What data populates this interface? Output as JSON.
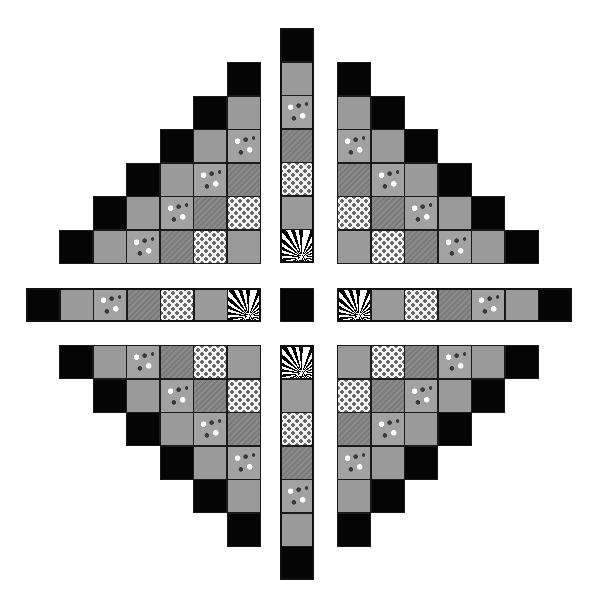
{
  "diagram": {
    "title": "",
    "legend": {
      "B": {
        "name": "black solid",
        "color": "#050505"
      },
      "G": {
        "name": "gray solid",
        "color": "#9a9a9a"
      },
      "D": {
        "name": "dark gray stripe",
        "color": "#7c7c7c"
      },
      "F": {
        "name": "gray with scattered white flowers",
        "color": "#a2a2a2"
      },
      "W": {
        "name": "white with small gray flowers",
        "color": "#f4f4f4"
      },
      "X": {
        "name": "large black and white flower print",
        "color": "#000000"
      }
    },
    "cell_size": 33.5,
    "pieces": {
      "top_left_triangle": {
        "x": 59,
        "y": 62,
        "rows": [
          [
            "",
            "",
            "",
            "",
            "",
            "B"
          ],
          [
            "",
            "",
            "",
            "",
            "B",
            "G"
          ],
          [
            "",
            "",
            "",
            "B",
            "G",
            "F"
          ],
          [
            "",
            "",
            "B",
            "G",
            "F",
            "D"
          ],
          [
            "",
            "B",
            "G",
            "F",
            "D",
            "W"
          ],
          [
            "B",
            "G",
            "F",
            "D",
            "W",
            "G"
          ]
        ]
      },
      "top_right_triangle": {
        "x": 337,
        "y": 62,
        "rows": [
          [
            "B",
            "",
            "",
            "",
            "",
            ""
          ],
          [
            "G",
            "B",
            "",
            "",
            "",
            ""
          ],
          [
            "F",
            "G",
            "B",
            "",
            "",
            ""
          ],
          [
            "D",
            "F",
            "G",
            "B",
            "",
            ""
          ],
          [
            "W",
            "D",
            "F",
            "G",
            "B",
            ""
          ],
          [
            "G",
            "W",
            "D",
            "F",
            "G",
            "B"
          ]
        ]
      },
      "bottom_left_triangle": {
        "x": 59,
        "y": 345,
        "rows": [
          [
            "B",
            "G",
            "F",
            "D",
            "W",
            "G"
          ],
          [
            "",
            "B",
            "G",
            "F",
            "D",
            "W"
          ],
          [
            "",
            "",
            "B",
            "G",
            "F",
            "D"
          ],
          [
            "",
            "",
            "",
            "B",
            "G",
            "F"
          ],
          [
            "",
            "",
            "",
            "",
            "B",
            "G"
          ],
          [
            "",
            "",
            "",
            "",
            "",
            "B"
          ]
        ]
      },
      "bottom_right_triangle": {
        "x": 337,
        "y": 345,
        "rows": [
          [
            "G",
            "W",
            "D",
            "F",
            "G",
            "B"
          ],
          [
            "W",
            "D",
            "F",
            "G",
            "B",
            ""
          ],
          [
            "D",
            "F",
            "G",
            "B",
            "",
            ""
          ],
          [
            "F",
            "G",
            "B",
            "",
            "",
            ""
          ],
          [
            "G",
            "B",
            "",
            "",
            "",
            ""
          ],
          [
            "B",
            "",
            "",
            "",
            "",
            ""
          ]
        ]
      },
      "top_strip": {
        "x": 280,
        "y": 28,
        "orientation": "vertical",
        "cells": [
          "B",
          "G",
          "F",
          "D",
          "W",
          "G",
          "X"
        ]
      },
      "bottom_strip": {
        "x": 280,
        "y": 345,
        "orientation": "vertical",
        "cells": [
          "X",
          "G",
          "W",
          "D",
          "F",
          "G",
          "B"
        ]
      },
      "left_strip": {
        "x": 26,
        "y": 288,
        "orientation": "horizontal",
        "cells": [
          "B",
          "G",
          "F",
          "D",
          "W",
          "G",
          "X"
        ]
      },
      "right_strip": {
        "x": 337,
        "y": 288,
        "orientation": "horizontal",
        "cells": [
          "X",
          "G",
          "W",
          "D",
          "F",
          "G",
          "B"
        ]
      },
      "center_square": {
        "x": 280,
        "y": 288,
        "cells": [
          "B"
        ]
      }
    }
  }
}
